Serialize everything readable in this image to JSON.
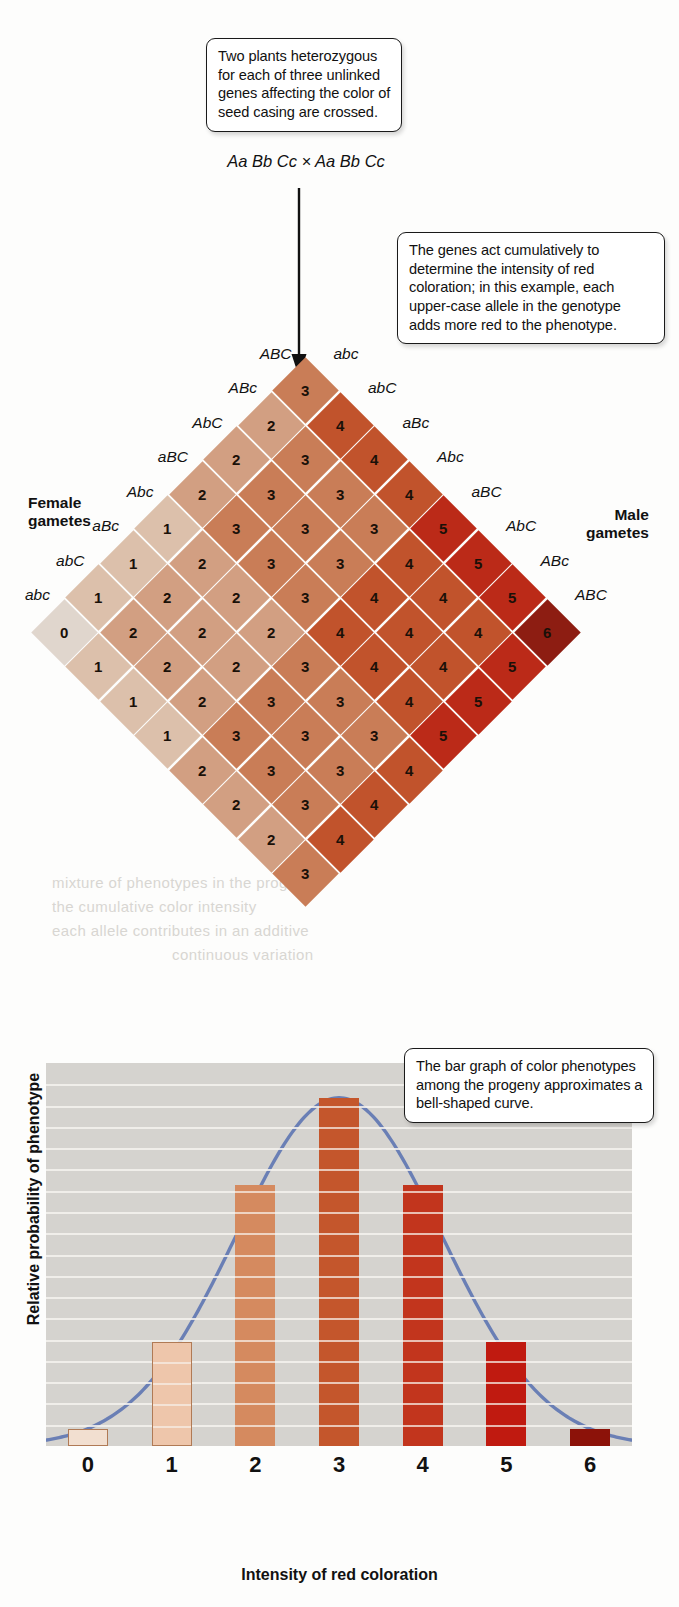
{
  "figure": {
    "callouts": [
      {
        "id": "cross",
        "text": "Two plants heterozygous for each of three unlinked genes affecting the color of seed casing are crossed."
      },
      {
        "id": "genes",
        "text": "The genes act cumulatively to determine the intensity of red coloration; in this example, each upper-case allele in the genotype adds more red to the phenotype."
      },
      {
        "id": "bargraph",
        "text": "The bar graph of color phenotypes among the progeny approximates a bell-shaped curve."
      }
    ],
    "cross_text": "Aa Bb Cc × Aa Bb Cc",
    "female_gametes_label": "Female\ngametes",
    "male_gametes_label": "Male\ngametes"
  },
  "punnett": {
    "female_gametes": [
      "abc",
      "abC",
      "aBc",
      "Abc",
      "aBC",
      "AbC",
      "ABc",
      "ABC"
    ],
    "male_gametes": [
      "abc",
      "abC",
      "aBc",
      "Abc",
      "aBC",
      "AbC",
      "ABc",
      "ABC"
    ],
    "values": [
      [
        0,
        1,
        1,
        1,
        2,
        2,
        2,
        3
      ],
      [
        1,
        2,
        2,
        2,
        3,
        3,
        3,
        4
      ],
      [
        1,
        2,
        2,
        2,
        3,
        3,
        3,
        4
      ],
      [
        1,
        2,
        2,
        2,
        3,
        3,
        3,
        4
      ],
      [
        2,
        3,
        3,
        3,
        4,
        4,
        4,
        5
      ],
      [
        2,
        3,
        3,
        3,
        4,
        4,
        4,
        5
      ],
      [
        2,
        3,
        3,
        3,
        4,
        4,
        4,
        5
      ],
      [
        3,
        4,
        4,
        4,
        5,
        5,
        5,
        6
      ]
    ],
    "colors": [
      "#e0d6cd",
      "#dcc0ab",
      "#d29f82",
      "#c97d57",
      "#c1532c",
      "#bb2a18",
      "#8d1d12"
    ]
  },
  "chart_data": {
    "type": "bar",
    "title": "",
    "xlabel": "Intensity of red coloration",
    "ylabel": "Relative probability of phenotype",
    "categories": [
      "0",
      "1",
      "2",
      "3",
      "4",
      "5",
      "6"
    ],
    "values": [
      1,
      6,
      15,
      20,
      15,
      6,
      1
    ],
    "values_note": "counts out of 64 progeny",
    "ylim": [
      0,
      22
    ],
    "grid": true,
    "gridlines": 17,
    "legend": "none",
    "bar_colors": [
      "#f2dfd0",
      "#eec6ab",
      "#d58a5f",
      "#c4562c",
      "#c2351d",
      "#c01a10",
      "#8c1209"
    ],
    "overlay_curve": {
      "name": "bell-shaped curve",
      "color": "#6a7fb5"
    }
  },
  "bleed_text": {
    "line1": "mixture of phenotypes in the progeny",
    "line2": "the cumulative color intensity",
    "line3": "each allele contributes in an additive",
    "line4": "continuous variation"
  }
}
